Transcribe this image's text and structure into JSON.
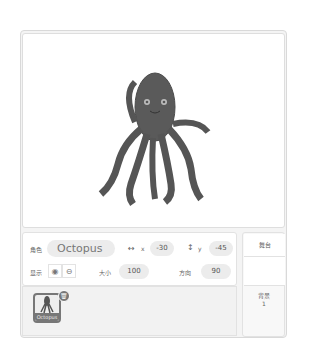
{
  "stage": {
    "sprite_name": "Octopus"
  },
  "sprite_info": {
    "sprite_label": "角色",
    "sprite_name": "Octopus",
    "x_icon": "↔",
    "x_label": "x",
    "x_value": "-30",
    "y_icon": "↕",
    "y_label": "y",
    "y_value": "-45",
    "show_label": "显示",
    "show_icon": "eye-icon",
    "hide_icon": "eye-slash-icon",
    "size_label": "大小",
    "size_value": "100",
    "direction_label": "方向",
    "direction_value": "90"
  },
  "sprite_list": [
    {
      "name": "Octopus",
      "selected": true
    }
  ],
  "stage_panel": {
    "title": "舞台",
    "backdrops_label": "背景",
    "backdrops_count": "1"
  }
}
